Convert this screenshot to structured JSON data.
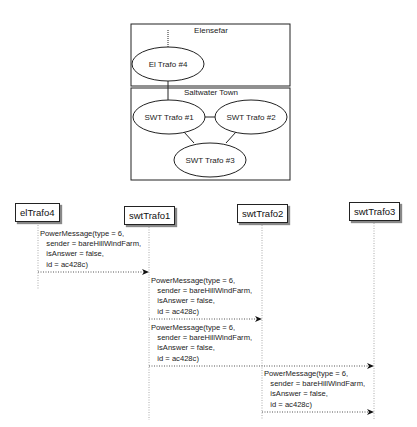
{
  "topology": {
    "regions": [
      {
        "id": "elensefar",
        "label": "Elensefar"
      },
      {
        "id": "saltwater",
        "label": "Saltwater Town"
      }
    ],
    "nodes": [
      {
        "id": "el4",
        "label": "El Trafo #4"
      },
      {
        "id": "swt1",
        "label": "SWT Trafo #1"
      },
      {
        "id": "swt2",
        "label": "SWT Trafo #2"
      },
      {
        "id": "swt3",
        "label": "SWT Trafo #3"
      }
    ]
  },
  "sequence": {
    "participants": [
      {
        "id": "elTrafo4",
        "label": "elTrafo4"
      },
      {
        "id": "swtTrafo1",
        "label": "swtTrafo1"
      },
      {
        "id": "swtTrafo2",
        "label": "swtTrafo2"
      },
      {
        "id": "swtTrafo3",
        "label": "swtTrafo3"
      }
    ],
    "messages": [
      {
        "from": "elTrafo4",
        "to": "swtTrafo1",
        "text": "PowerMessage(type = 6,\n   sender = bareHillWindFarm,\n   isAnswer = false,\n   id = ac428c)"
      },
      {
        "from": "swtTrafo1",
        "to": "swtTrafo2",
        "text": "PowerMessage(type = 6,\n   sender = bareHillWindFarm,\n   isAnswer = false,\n   id = ac428c)"
      },
      {
        "from": "swtTrafo1",
        "to": "swtTrafo3",
        "text": "PowerMessage(type = 6,\n   sender = bareHillWindFarm,\n   isAnswer = false,\n   id = ac428c)"
      },
      {
        "from": "swtTrafo2",
        "to": "swtTrafo3",
        "text": "PowerMessage(type = 6,\n   sender = bareHillWindFarm,\n   isAnswer = false,\n   id = ac428c)"
      }
    ]
  }
}
